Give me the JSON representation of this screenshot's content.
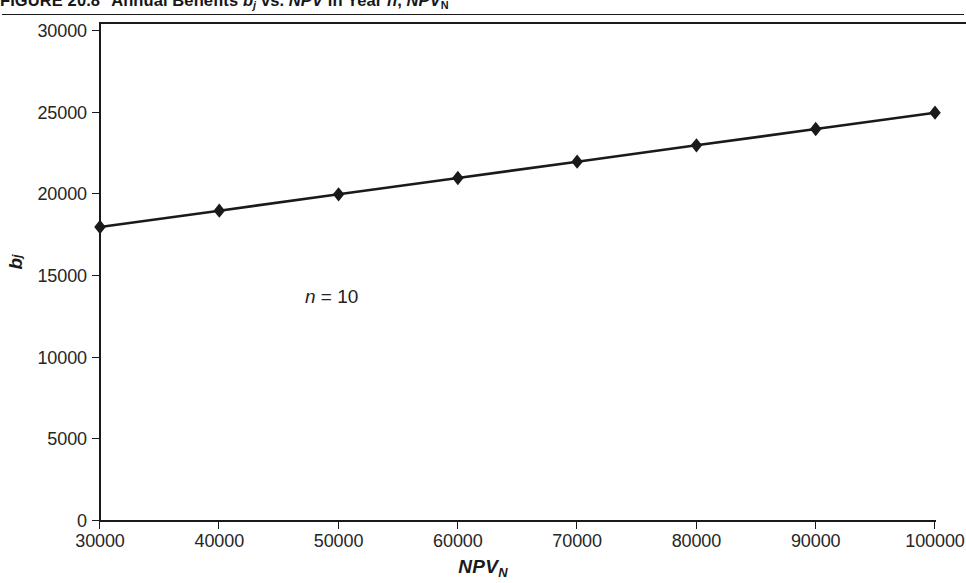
{
  "figure": {
    "label": "FIGURE 20.8",
    "title_part1": "Annual Benefits ",
    "title_b": "b",
    "title_b_sub": "j",
    "title_part2": " vs. ",
    "title_npv": "NPV",
    "title_part3": " in Year ",
    "title_n": "n",
    "title_comma": ", ",
    "title_npv2": "NPV",
    "title_npv2_sub": "N",
    "full_title": "FIGURE 20.8  Annual Benefits bj vs. NPV in Year n, NPVN"
  },
  "annotation": {
    "n_symbol": "n",
    "n_value": " = 10"
  },
  "axes": {
    "y_title_main": "b",
    "y_title_sub": "j",
    "x_title_main": "NPV",
    "x_title_sub": "N"
  },
  "colors": {
    "ink": "#1a1a1a",
    "text": "#262626",
    "background": "#ffffff",
    "series": "#1a1a1a"
  },
  "chart_data": {
    "type": "line",
    "xlabel": "NPV_N",
    "ylabel": "b_j",
    "x": [
      30000,
      40000,
      50000,
      60000,
      70000,
      80000,
      90000,
      100000
    ],
    "values": [
      18000,
      19000,
      20000,
      21000,
      22000,
      23000,
      24000,
      25000
    ],
    "series": [
      {
        "name": "b_j",
        "values": [
          18000,
          19000,
          20000,
          21000,
          22000,
          23000,
          24000,
          25000
        ],
        "marker": "diamond",
        "color": "#1a1a1a"
      }
    ],
    "xlim": [
      30000,
      100000
    ],
    "ylim": [
      0,
      30000
    ],
    "xticks": [
      30000,
      40000,
      50000,
      60000,
      70000,
      80000,
      90000,
      100000
    ],
    "yticks": [
      0,
      5000,
      10000,
      15000,
      20000,
      25000,
      30000
    ],
    "xticklabels": [
      "30000",
      "40000",
      "50000",
      "60000",
      "70000",
      "80000",
      "90000",
      "100000"
    ],
    "yticklabels": [
      "0",
      "5000",
      "10000",
      "15000",
      "20000",
      "25000",
      "30000"
    ],
    "grid": false,
    "legend": null,
    "annotations": [
      {
        "text": "n = 10",
        "x": 32800,
        "y": 14300
      }
    ]
  }
}
